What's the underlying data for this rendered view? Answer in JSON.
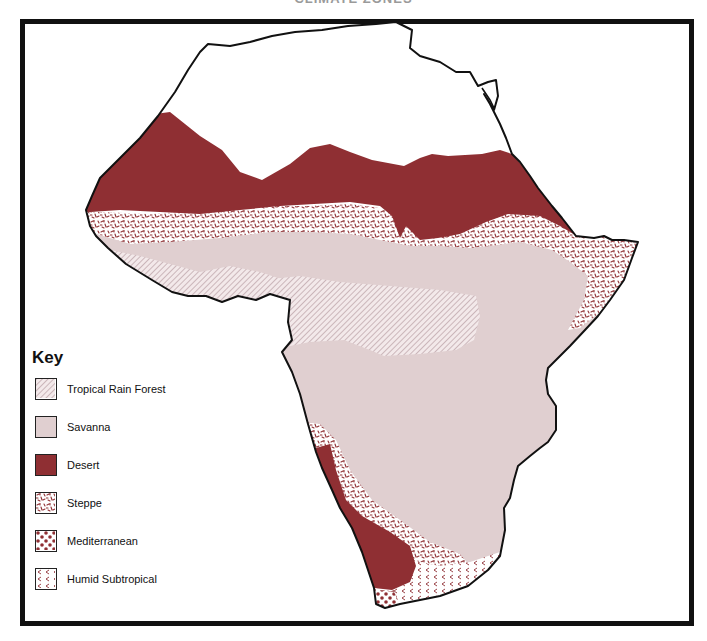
{
  "title": "CLIMATE ZONES",
  "colors": {
    "frame": "#111111",
    "coastline": "#111111",
    "desert": "#8f2f33",
    "savanna": "#e0cfd0",
    "rainforest_hatch": "#b59aa0",
    "steppe_mark": "#8f2f33",
    "background": "#ffffff"
  },
  "key": {
    "title": "Key",
    "items": [
      {
        "label": "Tropical Rain Forest",
        "pattern": "diagonal-hatch"
      },
      {
        "label": "Savanna",
        "pattern": "solid-light-pink"
      },
      {
        "label": "Desert",
        "pattern": "solid-maroon"
      },
      {
        "label": "Steppe",
        "pattern": "speckled"
      },
      {
        "label": "Mediterranean",
        "pattern": "dots"
      },
      {
        "label": "Humid Subtropical",
        "pattern": "chevrons"
      }
    ]
  },
  "regions": [
    {
      "name": "Sahara / Northern Desert",
      "zone": "Desert"
    },
    {
      "name": "Sahel belt",
      "zone": "Steppe"
    },
    {
      "name": "West & Central Africa",
      "zone": "Savanna"
    },
    {
      "name": "Congo Basin",
      "zone": "Tropical Rain Forest"
    },
    {
      "name": "Horn of Africa coast",
      "zone": "Steppe"
    },
    {
      "name": "Namib / Kalahari",
      "zone": "Desert"
    },
    {
      "name": "Southwest interior",
      "zone": "Steppe"
    },
    {
      "name": "Cape region",
      "zone": "Mediterranean"
    },
    {
      "name": "Southeast coast",
      "zone": "Humid Subtropical"
    },
    {
      "name": "North Africa coast",
      "zone": "Unshaded"
    }
  ]
}
